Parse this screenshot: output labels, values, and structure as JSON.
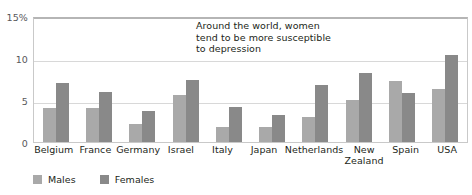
{
  "chart_data": {
    "type": "bar",
    "title": "",
    "xlabel": "",
    "ylabel": "",
    "ylim": [
      0,
      15
    ],
    "yticks": [
      0,
      5,
      10,
      15
    ],
    "ytick_labels": [
      "0",
      "5",
      "10",
      "15%"
    ],
    "grid": true,
    "legend_position": "bottom-left",
    "categories": [
      "Belgium",
      "France",
      "Germany",
      "Israel",
      "Italy",
      "Japan",
      "Netherlands",
      "New\nZealand",
      "Spain",
      "USA"
    ],
    "series": [
      {
        "name": "Males",
        "color": "#a9a9a9",
        "values": [
          4.0,
          4.0,
          2.2,
          5.6,
          1.8,
          1.8,
          3.0,
          5.0,
          7.3,
          6.3
        ]
      },
      {
        "name": "Females",
        "color": "#898989",
        "values": [
          7.0,
          6.0,
          3.7,
          7.4,
          4.2,
          3.2,
          6.8,
          8.2,
          5.8,
          10.3
        ]
      }
    ],
    "annotations": [
      {
        "text": "Around the world, women\ntend to be more susceptible\nto depression"
      }
    ]
  }
}
